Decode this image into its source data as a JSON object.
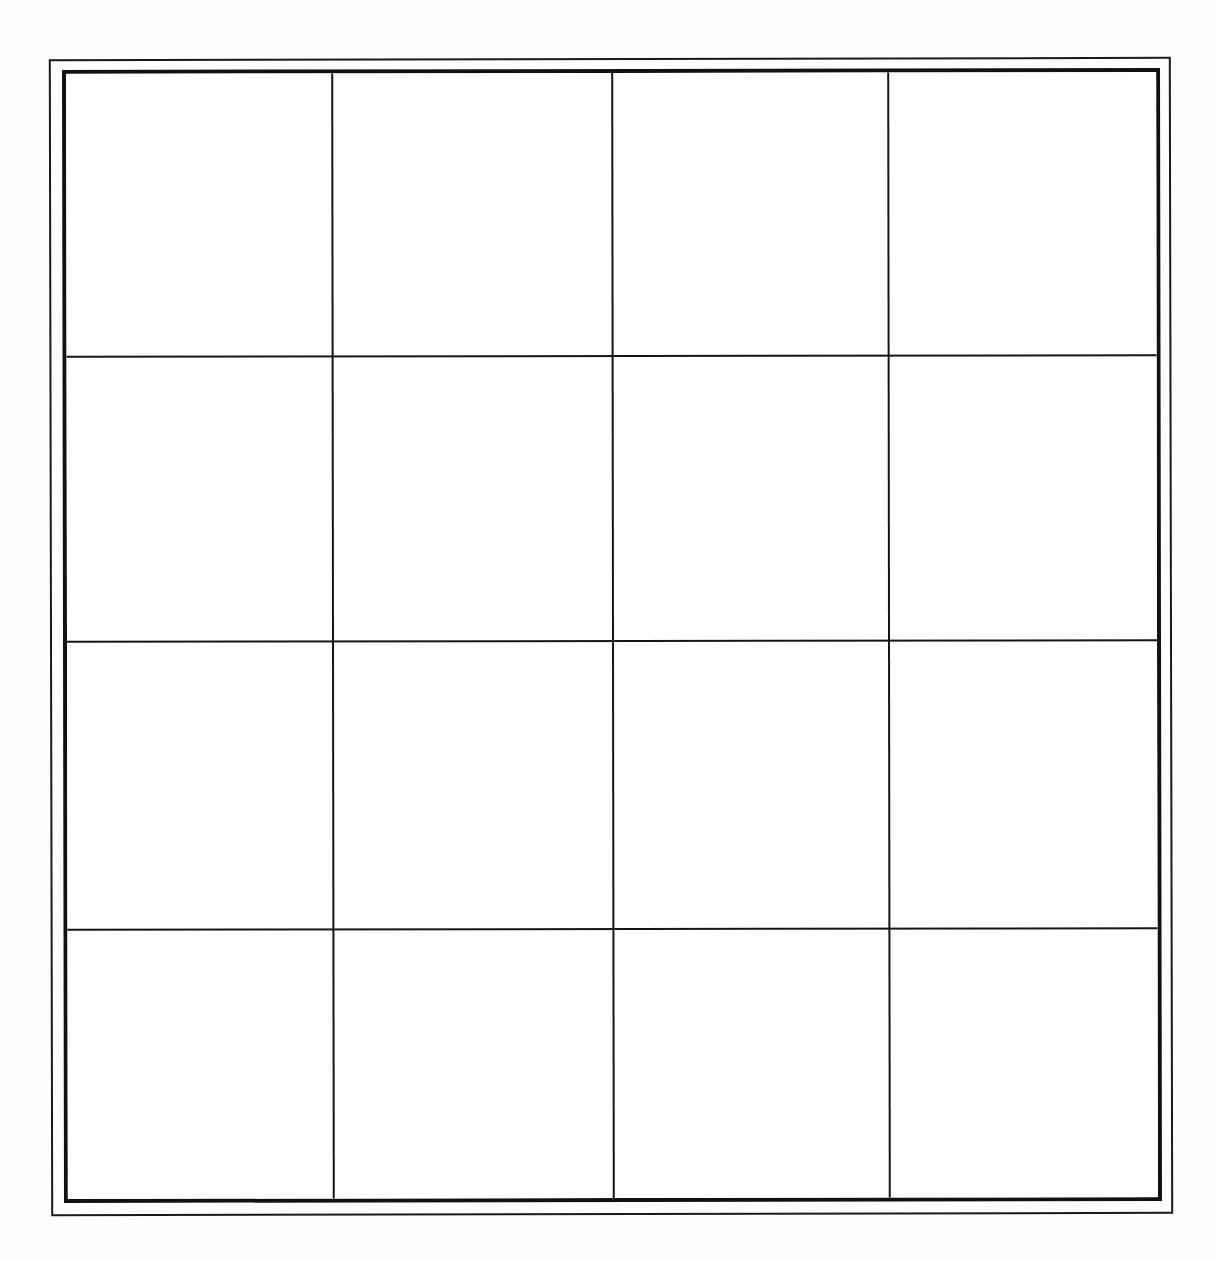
{
  "document": {
    "title": "Blank 4x4 Grid Table",
    "kind": "scanned-blank-grid",
    "background_color": "#fefefe",
    "line_color": "#151515"
  },
  "frame": {
    "style": "double-rule",
    "outer_line_color": "#1a1a1a",
    "inner_line_color": "#111111",
    "outer_line_width_px": 2,
    "inner_line_width_px": 4
  },
  "grid": {
    "rows": 4,
    "columns": 4,
    "cell_count": 16,
    "column_divider_x": [
      332,
      612,
      888
    ],
    "row_divider_y": [
      355,
      640,
      928
    ],
    "column_widths_px": [
      265,
      280,
      276,
      269
    ],
    "row_heights_px": [
      282,
      285,
      288,
      270
    ],
    "cells": [
      {
        "row": 1,
        "col": 1,
        "text": ""
      },
      {
        "row": 1,
        "col": 2,
        "text": ""
      },
      {
        "row": 1,
        "col": 3,
        "text": ""
      },
      {
        "row": 1,
        "col": 4,
        "text": ""
      },
      {
        "row": 2,
        "col": 1,
        "text": ""
      },
      {
        "row": 2,
        "col": 2,
        "text": ""
      },
      {
        "row": 2,
        "col": 3,
        "text": ""
      },
      {
        "row": 2,
        "col": 4,
        "text": ""
      },
      {
        "row": 3,
        "col": 1,
        "text": ""
      },
      {
        "row": 3,
        "col": 2,
        "text": ""
      },
      {
        "row": 3,
        "col": 3,
        "text": ""
      },
      {
        "row": 3,
        "col": 4,
        "text": ""
      },
      {
        "row": 4,
        "col": 1,
        "text": ""
      },
      {
        "row": 4,
        "col": 2,
        "text": ""
      },
      {
        "row": 4,
        "col": 3,
        "text": ""
      },
      {
        "row": 4,
        "col": 4,
        "text": ""
      }
    ]
  }
}
